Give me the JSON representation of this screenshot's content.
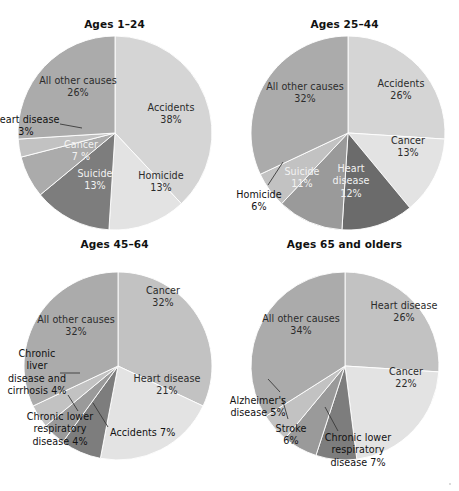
{
  "figure": {
    "background": "#ffffff",
    "width": 459,
    "height": 491
  },
  "palette": {
    "lightest": "#e3e3e3",
    "light": "#d5d5d5",
    "medium_light": "#c2c2c2",
    "medium": "#ababab",
    "medium_dark": "#9a9a9a",
    "dark": "#7d7d7d",
    "darkest": "#6b6b6b",
    "label_dark": "#2b2b2b",
    "label_light": "#f2f2f2",
    "leader_line": "#3a3a3a",
    "slice_border": "#ffffff"
  },
  "chart_data": [
    {
      "type": "pie",
      "title": "Ages 1–24",
      "start_angle_deg": 0,
      "direction": "clockwise",
      "categories": [
        "Accidents",
        "Homicide",
        "Suicide",
        "Cancer",
        "Heart disease",
        "All other causes"
      ],
      "values": [
        38,
        13,
        13,
        7,
        3,
        26
      ],
      "unit": "%",
      "slices": [
        {
          "label": "Accidents",
          "value": 38,
          "value_text": "38%",
          "color": "#d5d5d5",
          "label_placement": "inside",
          "label_tone": "dark"
        },
        {
          "label": "Homicide",
          "value": 13,
          "value_text": "13%",
          "color": "#e3e3e3",
          "label_placement": "inside",
          "label_tone": "dark"
        },
        {
          "label": "Suicide",
          "value": 13,
          "value_text": "13%",
          "color": "#7d7d7d",
          "label_placement": "inside",
          "label_tone": "light"
        },
        {
          "label": "Cancer",
          "value": 7,
          "value_text": "7 %",
          "color": "#ababab",
          "label_placement": "inside",
          "label_tone": "light"
        },
        {
          "label": "Heart disease",
          "value": 3,
          "value_text": "3%",
          "color": "#c2c2c2",
          "label_placement": "outside",
          "label_tone": "dark",
          "leader": true
        },
        {
          "label": "All other causes",
          "value": 26,
          "value_text": "26%",
          "color": "#ababab",
          "label_placement": "inside",
          "label_tone": "dark"
        }
      ]
    },
    {
      "type": "pie",
      "title": "Ages 25–44",
      "start_angle_deg": 0,
      "direction": "clockwise",
      "categories": [
        "Accidents",
        "Cancer",
        "Heart disease",
        "Suicide",
        "Homicide",
        "All other causes"
      ],
      "values": [
        26,
        13,
        12,
        11,
        6,
        32
      ],
      "unit": "%",
      "slices": [
        {
          "label": "Accidents",
          "value": 26,
          "value_text": "26%",
          "color": "#d5d5d5",
          "label_placement": "inside",
          "label_tone": "dark"
        },
        {
          "label": "Cancer",
          "value": 13,
          "value_text": "13%",
          "color": "#e3e3e3",
          "label_placement": "inside",
          "label_tone": "dark"
        },
        {
          "label": "Heart disease",
          "value": 12,
          "value_text": "12%",
          "color": "#6b6b6b",
          "label_placement": "inside",
          "label_tone": "light"
        },
        {
          "label": "Suicide",
          "value": 11,
          "value_text": "11%",
          "color": "#9a9a9a",
          "label_placement": "inside",
          "label_tone": "light"
        },
        {
          "label": "Homicide",
          "value": 6,
          "value_text": "6%",
          "color": "#c2c2c2",
          "label_placement": "outside",
          "label_tone": "dark",
          "leader": true
        },
        {
          "label": "All other causes",
          "value": 32,
          "value_text": "32%",
          "color": "#ababab",
          "label_placement": "inside",
          "label_tone": "dark"
        }
      ]
    },
    {
      "type": "pie",
      "title": "Ages 45–64",
      "start_angle_deg": 0,
      "direction": "clockwise",
      "categories": [
        "Cancer",
        "Heart disease",
        "Accidents",
        "Chronic lower respiratory disease",
        "Chronic liver disease and cirrhosis",
        "All other causes"
      ],
      "values": [
        32,
        21,
        7,
        4,
        4,
        32
      ],
      "unit": "%",
      "slices": [
        {
          "label": "Cancer",
          "value": 32,
          "value_text": "32%",
          "color": "#c2c2c2",
          "label_placement": "inside",
          "label_tone": "dark"
        },
        {
          "label": "Heart disease",
          "value": 21,
          "value_text": "21%",
          "color": "#e3e3e3",
          "label_placement": "inside",
          "label_tone": "dark"
        },
        {
          "label": "Accidents 7%",
          "value": 7,
          "value_text": "",
          "color": "#7d7d7d",
          "label_placement": "outside",
          "label_tone": "dark",
          "leader": true
        },
        {
          "label": "Chronic lower\nrespiratory\ndisease 4%",
          "value": 4,
          "value_text": "",
          "color": "#9a9a9a",
          "label_placement": "outside",
          "label_tone": "dark",
          "leader": true
        },
        {
          "label": "Chronic\nliver\ndisease and\ncirrhosis 4%",
          "value": 4,
          "value_text": "",
          "color": "#c2c2c2",
          "label_placement": "outside",
          "label_tone": "dark",
          "leader": true
        },
        {
          "label": "All other causes",
          "value": 32,
          "value_text": "32%",
          "color": "#ababab",
          "label_placement": "inside",
          "label_tone": "dark"
        }
      ]
    },
    {
      "type": "pie",
      "title": "Ages 65 and olders",
      "start_angle_deg": 0,
      "direction": "clockwise",
      "categories": [
        "Heart disease",
        "Cancer",
        "Chronic lower respiratory disease",
        "Stroke",
        "Alzheimer's disease",
        "All other causes"
      ],
      "values": [
        26,
        22,
        7,
        6,
        5,
        34
      ],
      "unit": "%",
      "slices": [
        {
          "label": "Heart disease",
          "value": 26,
          "value_text": "26%",
          "color": "#c2c2c2",
          "label_placement": "inside",
          "label_tone": "dark"
        },
        {
          "label": "Cancer",
          "value": 22,
          "value_text": "22%",
          "color": "#e3e3e3",
          "label_placement": "inside",
          "label_tone": "dark"
        },
        {
          "label": "Chronic lower\nrespiratory\ndisease 7%",
          "value": 7,
          "value_text": "",
          "color": "#7d7d7d",
          "label_placement": "outside",
          "label_tone": "dark",
          "leader": true
        },
        {
          "label": "Stroke\n6%",
          "value": 6,
          "value_text": "",
          "color": "#9a9a9a",
          "label_placement": "outside",
          "label_tone": "dark",
          "leader": true
        },
        {
          "label": "Alzheimer's\ndisease 5%",
          "value": 5,
          "value_text": "",
          "color": "#c2c2c2",
          "label_placement": "outside",
          "label_tone": "dark",
          "leader": true
        },
        {
          "label": "All other causes",
          "value": 34,
          "value_text": "34%",
          "color": "#ababab",
          "label_placement": "inside",
          "label_tone": "dark"
        }
      ]
    }
  ],
  "geometry": [
    {
      "cx": 115,
      "cy": 133,
      "r": 97,
      "labels": [
        {
          "for": "Accidents",
          "x": 128,
          "y": 102,
          "w": 86,
          "align": "center"
        },
        {
          "for": "Homicide",
          "x": 125,
          "y": 170,
          "w": 72,
          "align": "center"
        },
        {
          "for": "Suicide",
          "x": 62,
          "y": 168,
          "w": 66,
          "align": "center"
        },
        {
          "for": "Cancer",
          "x": 48,
          "y": 139,
          "w": 66,
          "align": "center"
        },
        {
          "for": "Heart disease",
          "x": -8,
          "y": 114,
          "w": 68,
          "align": "center",
          "leader": {
            "x1": 60,
            "y1": 124,
            "x2": 82,
            "y2": 128
          }
        },
        {
          "for": "All other causes",
          "x": 25,
          "y": 75,
          "w": 106,
          "align": "center"
        }
      ]
    },
    {
      "cx": 118,
      "cy": 133,
      "r": 97,
      "labels": [
        {
          "for": "Accidents",
          "x": 128,
          "y": 78,
          "w": 86,
          "align": "center"
        },
        {
          "for": "Cancer",
          "x": 140,
          "y": 135,
          "w": 76,
          "align": "center"
        },
        {
          "for": "Heart disease",
          "x": 91,
          "y": 163,
          "w": 60,
          "align": "center"
        },
        {
          "for": "Suicide",
          "x": 41,
          "y": 166,
          "w": 62,
          "align": "center"
        },
        {
          "for": "Homicide",
          "x": -7,
          "y": 189,
          "w": 72,
          "align": "center",
          "leader": {
            "x1": 38,
            "y1": 185,
            "x2": 53,
            "y2": 162
          }
        },
        {
          "for": "All other causes",
          "x": 22,
          "y": 81,
          "w": 106,
          "align": "center"
        }
      ]
    },
    {
      "cx": 118,
      "cy": 131,
      "r": 94,
      "labels": [
        {
          "for": "Cancer",
          "x": 125,
          "y": 50,
          "w": 76,
          "align": "center"
        },
        {
          "for": "Heart disease",
          "x": 118,
          "y": 138,
          "w": 98,
          "align": "center"
        },
        {
          "for": "Accidents 7%",
          "x": 110,
          "y": 192,
          "w": 78,
          "align": "left",
          "leader": {
            "x1": 108,
            "y1": 192,
            "x2": 93,
            "y2": 168
          }
        },
        {
          "for": "Chronic lower\nrespiratory\ndisease 4%",
          "x": 17,
          "y": 176,
          "w": 86,
          "align": "center",
          "leader": {
            "x1": 78,
            "y1": 176,
            "x2": 68,
            "y2": 160
          }
        },
        {
          "for": "Chronic\nliver\ndisease and\ncirrhosis 4%",
          "x": -5,
          "y": 113,
          "w": 84,
          "align": "center",
          "leader": {
            "x1": 60,
            "y1": 138,
            "x2": 80,
            "y2": 138
          }
        },
        {
          "for": "All other causes",
          "x": 23,
          "y": 79,
          "w": 106,
          "align": "center"
        }
      ]
    },
    {
      "cx": 115,
      "cy": 131,
      "r": 94,
      "labels": [
        {
          "for": "Heart disease",
          "x": 125,
          "y": 65,
          "w": 98,
          "align": "center"
        },
        {
          "for": "Cancer",
          "x": 138,
          "y": 131,
          "w": 76,
          "align": "center"
        },
        {
          "for": "Chronic lower\nrespiratory\ndisease 7%",
          "x": 80,
          "y": 197,
          "w": 96,
          "align": "center",
          "leader": {
            "x1": 108,
            "y1": 196,
            "x2": 95,
            "y2": 172
          }
        },
        {
          "for": "Stroke\n6%",
          "x": 30,
          "y": 188,
          "w": 62,
          "align": "center",
          "leader": {
            "x1": 58,
            "y1": 184,
            "x2": 52,
            "y2": 163
          }
        },
        {
          "for": "Alzheimer's\ndisease 5%",
          "x": -19,
          "y": 160,
          "w": 94,
          "align": "center",
          "leader": {
            "x1": 50,
            "y1": 157,
            "x2": 38,
            "y2": 144
          }
        },
        {
          "for": "All other causes",
          "x": 18,
          "y": 78,
          "w": 106,
          "align": "center"
        }
      ]
    }
  ]
}
